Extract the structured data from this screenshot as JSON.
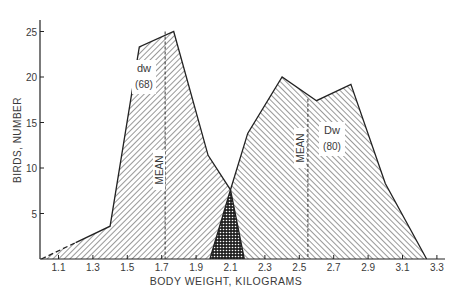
{
  "chart_data": {
    "type": "area",
    "title": "",
    "xlabel": "BODY WEIGHT, KILOGRAMS",
    "ylabel": "BIRDS, NUMBER",
    "xlim": [
      1.0,
      3.35
    ],
    "ylim": [
      0,
      26
    ],
    "grid": false,
    "legend_position": "inline",
    "x_ticks": [
      "1.1",
      "1.3",
      "1.5",
      "1.7",
      "1.9",
      "2.1",
      "2.3",
      "2.5",
      "2.7",
      "2.9",
      "3.1",
      "3.3"
    ],
    "y_ticks": [
      "5",
      "10",
      "15",
      "20",
      "25"
    ],
    "series": [
      {
        "name": "dw",
        "label": "dw",
        "n_label": "(68)",
        "pattern": "hatch-forward",
        "x": [
          1.0,
          1.2,
          1.4,
          1.57,
          1.77,
          1.97,
          2.1,
          2.18
        ],
        "y": [
          0,
          1.8,
          3.6,
          23.3,
          25.0,
          11.4,
          7.6,
          0
        ],
        "dashed_segment": [
          1.0,
          1.2
        ],
        "mean": 1.72,
        "mean_label": "MEAN"
      },
      {
        "name": "Dw",
        "label": "Dw",
        "n_label": "(80)",
        "pattern": "hatch-backward",
        "x": [
          1.98,
          2.1,
          2.2,
          2.4,
          2.6,
          2.8,
          3.0,
          3.24
        ],
        "y": [
          0,
          7.6,
          13.8,
          20.0,
          17.4,
          19.2,
          8.3,
          0
        ],
        "mean": 2.55,
        "mean_label": "MEAN"
      }
    ],
    "overlap_region": {
      "pattern": "crosshatch",
      "x": [
        1.98,
        2.1,
        2.18
      ],
      "y": [
        0,
        7.6,
        0
      ]
    }
  }
}
